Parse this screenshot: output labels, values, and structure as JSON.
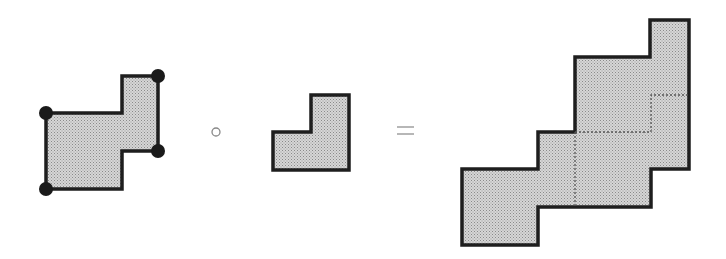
{
  "diagram": {
    "type": "shape-composition",
    "operators": {
      "compose": "∘",
      "equals": "="
    },
    "colors": {
      "stroke": "#1e1e1e",
      "fill": "#c9c9c9",
      "vertex": "#1a1a1a",
      "dotted": "#555555"
    },
    "left_operand": {
      "label": "shape with four marked vertices",
      "points": "46,113 122,113 122,76 158,76 158,151 122,151 122,189 46,189",
      "vertices": [
        [
          46,
          113
        ],
        [
          158,
          76
        ],
        [
          158,
          151
        ],
        [
          46,
          189
        ]
      ]
    },
    "right_operand": {
      "label": "L-shaped tile",
      "points": "273,132 311,132 311,95 349,95 349,170 273,170"
    },
    "result": {
      "label": "composed shape",
      "points": "462,169 538,169 538,132 575,132 575,57 650,57 650,20 689,20 689,169 651,169 651,207 538,207 538,245 462,245",
      "dotted_lines": [
        "575,132 651,132 651,95 689,95",
        "575,132 575,207"
      ]
    }
  }
}
